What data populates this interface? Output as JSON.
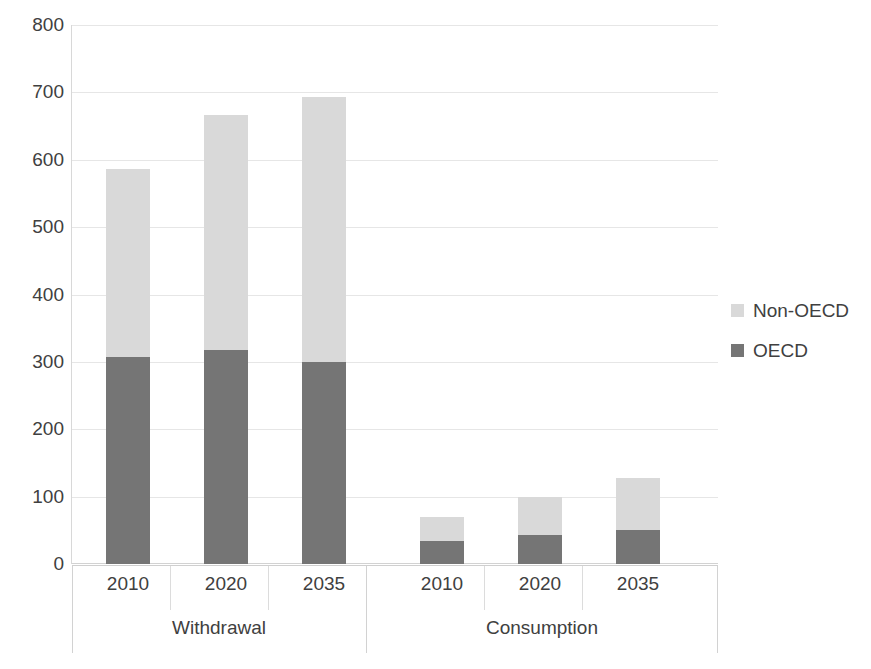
{
  "chart_data": {
    "type": "bar",
    "stacked": true,
    "title": "",
    "subtitle": "",
    "xlabel": "",
    "ylabel": "",
    "ylim": [
      0,
      800
    ],
    "ytick_step": 100,
    "yticks": [
      "800",
      "700",
      "600",
      "500",
      "400",
      "300",
      "200",
      "100",
      "0"
    ],
    "grid": true,
    "legend_position": "right",
    "groups": [
      {
        "label": "Withdrawal",
        "categories": [
          "2010",
          "2020",
          "2035"
        ]
      },
      {
        "label": "Consumption",
        "categories": [
          "2010",
          "2020",
          "2035"
        ]
      }
    ],
    "categories": [
      "2010",
      "2020",
      "2035",
      "2010",
      "2020",
      "2035"
    ],
    "series": [
      {
        "name": "OECD",
        "color": "#757575",
        "values": [
          307,
          317,
          300,
          34,
          43,
          50
        ]
      },
      {
        "name": "Non-OECD",
        "color": "#d9d9d9",
        "values": [
          279,
          349,
          393,
          36,
          57,
          78
        ]
      }
    ],
    "totals": [
      586,
      666,
      693,
      70,
      100,
      128
    ],
    "stack_order_bottom_to_top": [
      "OECD",
      "Non-OECD"
    ]
  },
  "legend": {
    "items": [
      {
        "label": "Non-OECD",
        "color": "#d9d9d9"
      },
      {
        "label": "OECD",
        "color": "#757575"
      }
    ]
  },
  "axis": {
    "y_ticks": [
      "800",
      "700",
      "600",
      "500",
      "400",
      "300",
      "200",
      "100",
      "0"
    ],
    "x_ticks": [
      "2010",
      "2020",
      "2035",
      "2010",
      "2020",
      "2035"
    ],
    "group_labels": [
      "Withdrawal",
      "Consumption"
    ]
  },
  "colors": {
    "oecd": "#757575",
    "non_oecd": "#d9d9d9",
    "gridline": "#e6e6e6",
    "text": "#404040",
    "background": "#ffffff"
  }
}
